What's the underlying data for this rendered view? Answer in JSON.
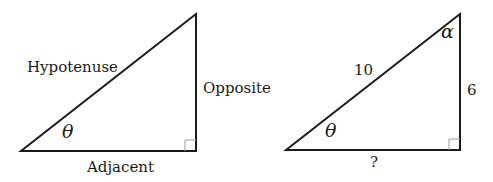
{
  "triangles": [
    {
      "id": "generic",
      "labels": {
        "hypotenuse": "Hypotenuse",
        "opposite": "Opposite",
        "adjacent": "Adjacent",
        "angle": "θ"
      },
      "right_angle_marker": true
    },
    {
      "id": "numeric",
      "labels": {
        "hypotenuse": "10",
        "opposite": "6",
        "adjacent": "?",
        "angle": "θ",
        "top_angle": "α"
      },
      "right_angle_marker": true
    }
  ],
  "colors": {
    "line": "#1a1a1a",
    "marker": "#9a9a9a",
    "background": "#ffffff"
  }
}
